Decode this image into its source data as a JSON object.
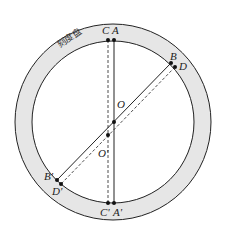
{
  "diagram": {
    "dial_label": "刻度盘",
    "points": {
      "A": "A",
      "C": "C",
      "B": "B",
      "D": "D",
      "O": "O",
      "O_prime": "O'",
      "A_prime": "A'",
      "C_prime": "C'",
      "B_prime": "B'",
      "D_prime": "D'"
    },
    "colors": {
      "ring_fill": "#e6e6e6",
      "stroke": "#222222",
      "background": "#ffffff"
    }
  }
}
